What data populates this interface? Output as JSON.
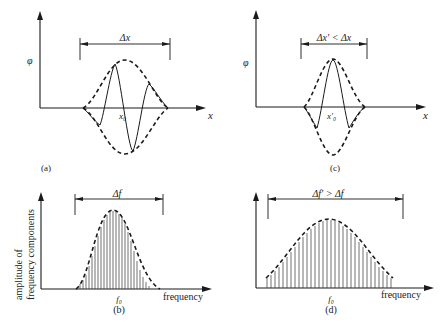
{
  "panels": {
    "a": {
      "caption": "(a)",
      "y_label": "φ",
      "x_label": "x",
      "center_label": "x₀",
      "width_label": "Δx"
    },
    "c": {
      "caption": "(c)",
      "y_label": "φ",
      "x_label": "x",
      "center_label": "x'₀",
      "width_label": "Δx' < Δx"
    },
    "b": {
      "caption": "(b)",
      "y_label_line1": "amplitude of",
      "y_label_line2": "frequency components",
      "x_label": "frequency",
      "center_label": "f₀",
      "width_label": "Δf"
    },
    "d": {
      "caption": "(d)",
      "x_label": "frequency",
      "center_label": "f₀",
      "width_label": "Δf' > Δf"
    }
  },
  "colors": {
    "ink": "#1a1a1a",
    "background": "#ffffff"
  }
}
